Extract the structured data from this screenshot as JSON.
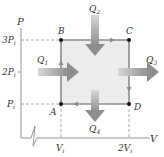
{
  "diagram": {
    "type": "pv-diagram",
    "axes": {
      "y_label": "P",
      "x_label": "V",
      "y_ticks": [
        "3P_i",
        "2P_i",
        "P_i"
      ],
      "x_ticks": [
        "V_i",
        "2V_i"
      ]
    },
    "tick_labels": {
      "p3": "3P",
      "p2": "2P",
      "p1": "P",
      "sub_i": "i",
      "v1": "V",
      "v2": "2V"
    },
    "points": [
      {
        "name": "A",
        "V": "V_i",
        "P": "P_i"
      },
      {
        "name": "B",
        "V": "V_i",
        "P": "3P_i"
      },
      {
        "name": "C",
        "V": "2V_i",
        "P": "3P_i"
      },
      {
        "name": "D",
        "V": "2V_i",
        "P": "P_i"
      }
    ],
    "point_labels": {
      "A": "A",
      "B": "B",
      "C": "C",
      "D": "D"
    },
    "cycle": [
      "A",
      "B",
      "C",
      "D",
      "A"
    ],
    "heat_flows": [
      {
        "name": "Q_1",
        "base": "Q",
        "sub": "1",
        "direction": "in",
        "side": "left"
      },
      {
        "name": "Q_2",
        "base": "Q",
        "sub": "2",
        "direction": "in",
        "side": "top"
      },
      {
        "name": "Q_3",
        "base": "Q",
        "sub": "3",
        "direction": "out",
        "side": "right"
      },
      {
        "name": "Q_4",
        "base": "Q",
        "sub": "4",
        "direction": "out",
        "side": "bottom"
      }
    ],
    "colors": {
      "axis": "#8a8a8a",
      "cycle_line": "#8c8c8c",
      "fill": "#ececec",
      "arrow": "#9a9a9a",
      "point": "#111111",
      "dashed": "#999999"
    }
  }
}
